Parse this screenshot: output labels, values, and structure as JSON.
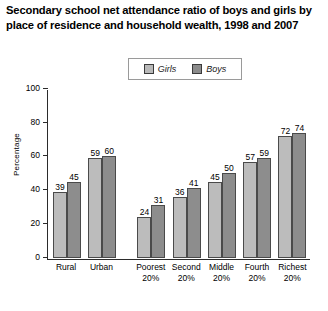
{
  "title": "Secondary school net attendance ratio of boys and girls by place of residence and household wealth, 1998 and 2007",
  "legend": {
    "items": [
      {
        "label": "Girls",
        "color": "#bcbcbc",
        "swatch_name": "girls-swatch"
      },
      {
        "label": "Boys",
        "color": "#8d8d8d",
        "swatch_name": "boys-swatch"
      }
    ]
  },
  "chart_data": {
    "type": "bar",
    "title": "Secondary school net attendance ratio of boys and girls by place of residence and household wealth, 1998 and 2007",
    "xlabel": "",
    "ylabel": "Percentage",
    "ylim": [
      0,
      100
    ],
    "yticks": [
      0,
      20,
      40,
      60,
      80,
      100
    ],
    "grid": false,
    "legend_position": "top-center",
    "categories": [
      "Rural",
      "Urban",
      "Poorest 20%",
      "Second 20%",
      "Middle 20%",
      "Fourth 20%",
      "Richest 20%"
    ],
    "category_lines": [
      [
        "Rural",
        ""
      ],
      [
        "Urban",
        ""
      ],
      [
        "Poorest",
        "20%"
      ],
      [
        "Second",
        "20%"
      ],
      [
        "Middle",
        "20%"
      ],
      [
        "Fourth",
        "20%"
      ],
      [
        "Richest",
        "20%"
      ]
    ],
    "series": [
      {
        "name": "Girls",
        "values": [
          39,
          59,
          24,
          36,
          45,
          57,
          72
        ]
      },
      {
        "name": "Boys",
        "values": [
          45,
          60,
          31,
          41,
          50,
          59,
          74
        ]
      }
    ]
  },
  "caption": ""
}
